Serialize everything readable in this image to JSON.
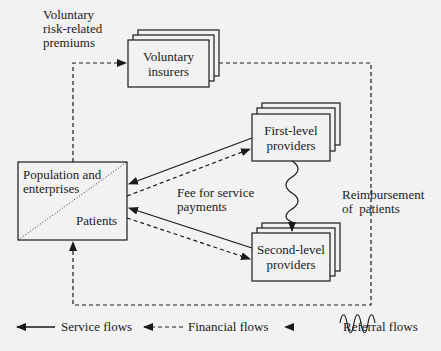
{
  "nodes": {
    "voluntary_insurers": {
      "line1": "Voluntary",
      "line2": "insurers"
    },
    "first_level": {
      "line1": "First-level",
      "line2": "providers"
    },
    "second_level": {
      "line1": "Second-level",
      "line2": "providers"
    },
    "population": {
      "top_line1": "Population and",
      "top_line2": "enterprises",
      "bottom": "Patients"
    }
  },
  "edge_labels": {
    "premiums": {
      "line1": "Voluntary",
      "line2": "risk-related",
      "line3": "premiums"
    },
    "fee": {
      "line1": "Fee for service",
      "line2": "payments"
    },
    "reimbursement": {
      "line1": "Reimbursement",
      "line2": "of  patients"
    }
  },
  "legend": {
    "service": "Service flows",
    "financial": "Financial flows",
    "referral": "Referral flows"
  },
  "colors": {
    "background": "#f2f2f2",
    "line": "#1a1a1a",
    "box_fill": "#f2f2f2"
  }
}
